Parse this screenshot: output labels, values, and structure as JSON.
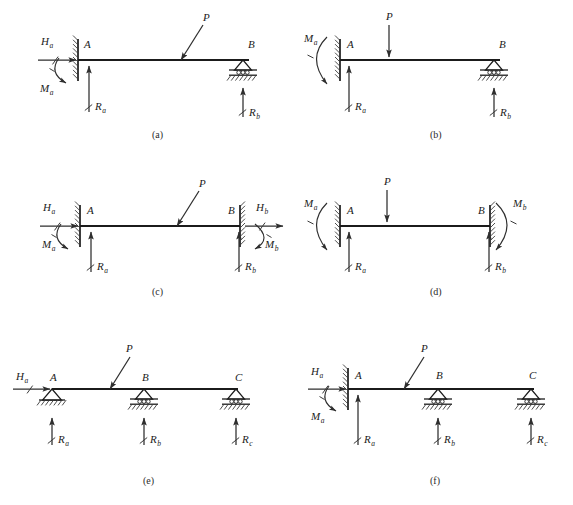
{
  "figure": {
    "background_color": "#ffffff",
    "line_color": "#1b1b1b",
    "arrow_color": "#2e2e2e",
    "width": 573,
    "height": 505
  },
  "panels": [
    {
      "id": "a",
      "caption": "(a)",
      "caption_x": 152,
      "caption_y": 138,
      "beam": {
        "x1": 78,
        "x2": 249,
        "y": 60
      },
      "nodes": [
        {
          "label": "A",
          "sub": "",
          "x": 84,
          "y": 48,
          "type": "node-label"
        },
        {
          "label": "B",
          "sub": "",
          "x": 248,
          "y": 48,
          "type": "node-label"
        }
      ],
      "supports": [
        {
          "kind": "fixed-wall",
          "x": 78,
          "y": 60,
          "side": "left"
        },
        {
          "kind": "roller",
          "x": 243,
          "y": 60
        }
      ],
      "loads": [
        {
          "name": "P",
          "kind": "inclined-point-load",
          "label": "P",
          "sub": "",
          "tip_x": 181,
          "tip_y": 60,
          "tail_x": 203,
          "tail_y": 25,
          "label_x": 203,
          "label_y": 21
        },
        {
          "name": "Ha",
          "kind": "horizontal-force",
          "label": "H",
          "sub": "a",
          "tail_x": 38,
          "tip_x": 76,
          "y": 60,
          "label_x": 41,
          "label_y": 45
        },
        {
          "name": "Ma",
          "kind": "moment-arc",
          "label": "M",
          "sub": "a",
          "cx": 79,
          "cy": 70,
          "label_x": 40,
          "label_y": 92
        },
        {
          "name": "Ra",
          "kind": "reaction-up",
          "label": "R",
          "sub": "a",
          "x": 89,
          "tail_y": 112,
          "tip_y": 66,
          "label_x": 95,
          "label_y": 110
        },
        {
          "name": "Rb",
          "kind": "reaction-up",
          "label": "R",
          "sub": "b",
          "x": 243,
          "tail_y": 117,
          "tip_y": 88,
          "label_x": 249,
          "label_y": 116
        }
      ]
    },
    {
      "id": "b",
      "caption": "(b)",
      "caption_x": 430,
      "caption_y": 138,
      "beam": {
        "x1": 340,
        "x2": 500,
        "y": 60
      },
      "nodes": [
        {
          "label": "A",
          "sub": "",
          "x": 347,
          "y": 48,
          "type": "node-label"
        },
        {
          "label": "B",
          "sub": "",
          "x": 499,
          "y": 48,
          "type": "node-label"
        }
      ],
      "supports": [
        {
          "kind": "fixed-wall",
          "x": 340,
          "y": 60,
          "side": "left"
        },
        {
          "kind": "roller",
          "x": 494,
          "y": 60
        }
      ],
      "loads": [
        {
          "name": "P",
          "kind": "vertical-point-load",
          "label": "P",
          "sub": "",
          "x": 389,
          "tail_y": 25,
          "tip_y": 57,
          "label_x": 386,
          "label_y": 20
        },
        {
          "name": "Ma",
          "kind": "moment-arc-left",
          "label": "M",
          "sub": "a",
          "cx": 332,
          "cy": 62,
          "label_x": 304,
          "label_y": 42
        },
        {
          "name": "Ra",
          "kind": "reaction-up",
          "label": "R",
          "sub": "a",
          "x": 349,
          "tail_y": 112,
          "tip_y": 66,
          "label_x": 355,
          "label_y": 110
        },
        {
          "name": "Rb",
          "kind": "reaction-up",
          "label": "R",
          "sub": "b",
          "x": 494,
          "tail_y": 117,
          "tip_y": 88,
          "label_x": 500,
          "label_y": 116
        }
      ]
    },
    {
      "id": "c",
      "caption": "(c)",
      "caption_x": 152,
      "caption_y": 295,
      "beam": {
        "x1": 80,
        "x2": 240,
        "y": 226
      },
      "nodes": [
        {
          "label": "A",
          "sub": "",
          "x": 87,
          "y": 214,
          "type": "node-label"
        },
        {
          "label": "B",
          "sub": "",
          "x": 228,
          "y": 214,
          "type": "node-label"
        }
      ],
      "supports": [
        {
          "kind": "fixed-wall",
          "x": 80,
          "y": 226,
          "side": "left"
        },
        {
          "kind": "fixed-wall",
          "x": 240,
          "y": 226,
          "side": "right"
        }
      ],
      "loads": [
        {
          "name": "P",
          "kind": "inclined-point-load",
          "label": "P",
          "sub": "",
          "tip_x": 177,
          "tip_y": 226,
          "tail_x": 199,
          "tail_y": 191,
          "label_x": 199,
          "label_y": 187
        },
        {
          "name": "Ha",
          "kind": "horizontal-force",
          "label": "H",
          "sub": "a",
          "tail_x": 40,
          "tip_x": 78,
          "y": 226,
          "label_x": 43,
          "label_y": 211
        },
        {
          "name": "Ma",
          "kind": "moment-arc",
          "label": "M",
          "sub": "a",
          "cx": 81,
          "cy": 236,
          "label_x": 42,
          "label_y": 248
        },
        {
          "name": "Ra",
          "kind": "reaction-up",
          "label": "R",
          "sub": "a",
          "x": 91,
          "tail_y": 272,
          "tip_y": 232,
          "label_x": 97,
          "label_y": 270
        },
        {
          "name": "Hb",
          "kind": "horizontal-force",
          "label": "H",
          "sub": "b",
          "tail_x": 245,
          "tip_x": 283,
          "y": 226,
          "label_x": 256,
          "label_y": 211
        },
        {
          "name": "Mb",
          "kind": "moment-arc-right",
          "label": "M",
          "sub": "b",
          "cx": 242,
          "cy": 236,
          "label_x": 265,
          "label_y": 248
        },
        {
          "name": "Rb",
          "kind": "reaction-up",
          "label": "R",
          "sub": "b",
          "x": 239,
          "tail_y": 272,
          "tip_y": 232,
          "label_x": 245,
          "label_y": 270
        }
      ]
    },
    {
      "id": "d",
      "caption": "(d)",
      "caption_x": 430,
      "caption_y": 295,
      "beam": {
        "x1": 340,
        "x2": 490,
        "y": 226
      },
      "nodes": [
        {
          "label": "A",
          "sub": "",
          "x": 347,
          "y": 214,
          "type": "node-label"
        },
        {
          "label": "B",
          "sub": "",
          "x": 478,
          "y": 214,
          "type": "node-label"
        }
      ],
      "supports": [
        {
          "kind": "fixed-wall",
          "x": 340,
          "y": 226,
          "side": "left"
        },
        {
          "kind": "fixed-wall",
          "x": 490,
          "y": 226,
          "side": "right"
        }
      ],
      "loads": [
        {
          "name": "P",
          "kind": "vertical-point-load",
          "label": "P",
          "sub": "",
          "x": 387,
          "tail_y": 190,
          "tip_y": 222,
          "label_x": 384,
          "label_y": 185
        },
        {
          "name": "Ma",
          "kind": "moment-arc-left",
          "label": "M",
          "sub": "a",
          "cx": 332,
          "cy": 228,
          "label_x": 304,
          "label_y": 207
        },
        {
          "name": "Ra",
          "kind": "reaction-up",
          "label": "R",
          "sub": "a",
          "x": 349,
          "tail_y": 272,
          "tip_y": 232,
          "label_x": 355,
          "label_y": 270
        },
        {
          "name": "Mb",
          "kind": "moment-arc-right-big",
          "label": "M",
          "sub": "b",
          "cx": 498,
          "cy": 228,
          "label_x": 513,
          "label_y": 207
        },
        {
          "name": "Rb",
          "kind": "reaction-up",
          "label": "R",
          "sub": "b",
          "x": 489,
          "tail_y": 272,
          "tip_y": 232,
          "label_x": 495,
          "label_y": 270
        }
      ]
    },
    {
      "id": "e",
      "caption": "(e)",
      "caption_x": 143,
      "caption_y": 484,
      "beam": {
        "x1": 52,
        "x2": 238,
        "y": 389
      },
      "nodes": [
        {
          "label": "A",
          "sub": "",
          "x": 50,
          "y": 381,
          "type": "node-label"
        },
        {
          "label": "B",
          "sub": "",
          "x": 142,
          "y": 381,
          "type": "node-label"
        },
        {
          "label": "C",
          "sub": "",
          "x": 235,
          "y": 381,
          "type": "node-label"
        }
      ],
      "supports": [
        {
          "kind": "pin",
          "x": 52,
          "y": 389
        },
        {
          "kind": "roller",
          "x": 144,
          "y": 389
        },
        {
          "kind": "roller",
          "x": 236,
          "y": 389
        }
      ],
      "loads": [
        {
          "name": "P",
          "kind": "inclined-point-load",
          "label": "P",
          "sub": "",
          "tip_x": 110,
          "tip_y": 389,
          "tail_x": 130,
          "tail_y": 357,
          "label_x": 126,
          "label_y": 352
        },
        {
          "name": "Ha",
          "kind": "horizontal-force",
          "label": "H",
          "sub": "a",
          "tail_x": 13,
          "tip_x": 50,
          "y": 389,
          "label_x": 16,
          "label_y": 380
        },
        {
          "name": "Ra",
          "kind": "reaction-up",
          "label": "R",
          "sub": "a",
          "x": 52,
          "tail_y": 445,
          "tip_y": 418,
          "label_x": 58,
          "label_y": 443
        },
        {
          "name": "Rb",
          "kind": "reaction-up",
          "label": "R",
          "sub": "b",
          "x": 144,
          "tail_y": 445,
          "tip_y": 418,
          "label_x": 150,
          "label_y": 443
        },
        {
          "name": "Rc",
          "kind": "reaction-up",
          "label": "R",
          "sub": "c",
          "x": 236,
          "tail_y": 445,
          "tip_y": 418,
          "label_x": 242,
          "label_y": 443
        }
      ]
    },
    {
      "id": "f",
      "caption": "(f)",
      "caption_x": 430,
      "caption_y": 484,
      "beam": {
        "x1": 348,
        "x2": 534,
        "y": 389
      },
      "nodes": [
        {
          "label": "A",
          "sub": "",
          "x": 355,
          "y": 379,
          "type": "node-label"
        },
        {
          "label": "B",
          "sub": "",
          "x": 436,
          "y": 379,
          "type": "node-label"
        },
        {
          "label": "C",
          "sub": "",
          "x": 529,
          "y": 379,
          "type": "node-label"
        }
      ],
      "supports": [
        {
          "kind": "fixed-wall",
          "x": 348,
          "y": 389,
          "side": "left"
        },
        {
          "kind": "roller",
          "x": 438,
          "y": 389
        },
        {
          "kind": "roller",
          "x": 531,
          "y": 389
        }
      ],
      "loads": [
        {
          "name": "P",
          "kind": "inclined-point-load",
          "label": "P",
          "sub": "",
          "tip_x": 404,
          "tip_y": 389,
          "tail_x": 424,
          "tail_y": 357,
          "label_x": 421,
          "label_y": 352
        },
        {
          "name": "Ha",
          "kind": "horizontal-force",
          "label": "H",
          "sub": "a",
          "tail_x": 308,
          "tip_x": 346,
          "y": 389,
          "label_x": 311,
          "label_y": 375
        },
        {
          "name": "Ma",
          "kind": "moment-arc",
          "label": "M",
          "sub": "a",
          "cx": 349,
          "cy": 398,
          "label_x": 311,
          "label_y": 420
        },
        {
          "name": "Ra",
          "kind": "reaction-up",
          "label": "R",
          "sub": "a",
          "x": 358,
          "tail_y": 445,
          "tip_y": 395,
          "label_x": 364,
          "label_y": 443
        },
        {
          "name": "Rb",
          "kind": "reaction-up",
          "label": "R",
          "sub": "b",
          "x": 438,
          "tail_y": 445,
          "tip_y": 418,
          "label_x": 444,
          "label_y": 443
        },
        {
          "name": "Rc",
          "kind": "reaction-up",
          "label": "R",
          "sub": "c",
          "x": 531,
          "tail_y": 445,
          "tip_y": 418,
          "label_x": 537,
          "label_y": 443
        }
      ]
    }
  ]
}
